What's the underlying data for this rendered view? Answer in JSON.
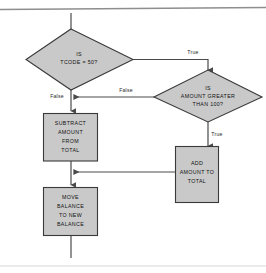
{
  "diagram": {
    "type": "flowchart",
    "background_color": "#ffffff",
    "node_fill_color": "#c9c9c9",
    "node_stroke_color": "#3a3a3a",
    "connector_color": "#4a4a4a",
    "nodes": [
      {
        "id": "decision-tcode",
        "shape": "diamond",
        "lines": [
          "IS",
          "TCODE = 50?"
        ]
      },
      {
        "id": "decision-amount",
        "shape": "diamond",
        "lines": [
          "IS",
          "AMOUNT GREATER",
          "THAN 100?"
        ]
      },
      {
        "id": "process-subtract",
        "shape": "rectangle",
        "lines": [
          "SUBTRACT",
          "AMOUNT",
          "FROM",
          "TOTAL"
        ]
      },
      {
        "id": "process-add",
        "shape": "rectangle",
        "lines": [
          "ADD",
          "AMOUNT TO",
          "TOTAL"
        ]
      },
      {
        "id": "process-move",
        "shape": "rectangle",
        "lines": [
          "MOVE",
          "BALANCE",
          "TO NEW",
          "BALANCE"
        ]
      }
    ],
    "edges": [
      {
        "id": "edge-tcode-true",
        "from": "decision-tcode",
        "to": "decision-amount",
        "label": "True"
      },
      {
        "id": "edge-tcode-false",
        "from": "decision-tcode",
        "to": "process-subtract",
        "label": "False"
      },
      {
        "id": "edge-amount-false",
        "from": "decision-amount",
        "to": "process-subtract",
        "label": "False"
      },
      {
        "id": "edge-amount-true",
        "from": "decision-amount",
        "to": "process-add",
        "label": "True"
      },
      {
        "id": "edge-add-merge",
        "from": "process-add",
        "to": "process-move",
        "label": ""
      },
      {
        "id": "edge-subtract-move",
        "from": "process-subtract",
        "to": "process-move",
        "label": ""
      },
      {
        "id": "edge-entry",
        "from": "entry",
        "to": "decision-tcode",
        "label": ""
      },
      {
        "id": "edge-exit",
        "from": "process-move",
        "to": "exit",
        "label": ""
      }
    ]
  }
}
